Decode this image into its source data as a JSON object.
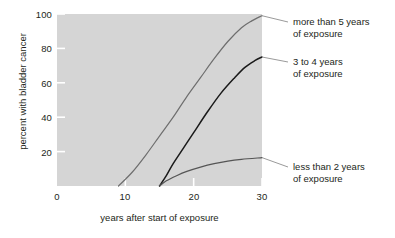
{
  "chart_data": {
    "type": "line",
    "title": "",
    "xlabel": "years after start of exposure",
    "ylabel": "percent with bladder cancer",
    "xlim": [
      0,
      30
    ],
    "ylim": [
      0,
      100
    ],
    "xticks": [
      0,
      10,
      20,
      30
    ],
    "yticks": [
      20,
      40,
      60,
      80,
      100
    ],
    "grid": false,
    "legend_position": "right-inline-annotations",
    "series": [
      {
        "name": "more than 5 years of exposure",
        "color": "#6e6e6e",
        "points": [
          {
            "x": 9,
            "y": 0
          },
          {
            "x": 11,
            "y": 8
          },
          {
            "x": 13,
            "y": 18
          },
          {
            "x": 15,
            "y": 29
          },
          {
            "x": 17,
            "y": 40
          },
          {
            "x": 19,
            "y": 52
          },
          {
            "x": 21,
            "y": 63
          },
          {
            "x": 23,
            "y": 74
          },
          {
            "x": 25,
            "y": 84
          },
          {
            "x": 27,
            "y": 92
          },
          {
            "x": 28.5,
            "y": 96
          },
          {
            "x": 30,
            "y": 99
          }
        ]
      },
      {
        "name": "3 to 4 years of exposure",
        "color": "#1a1a1a",
        "points": [
          {
            "x": 15,
            "y": 0
          },
          {
            "x": 16,
            "y": 6
          },
          {
            "x": 17,
            "y": 13
          },
          {
            "x": 18.5,
            "y": 22
          },
          {
            "x": 20,
            "y": 31
          },
          {
            "x": 22,
            "y": 43
          },
          {
            "x": 24,
            "y": 54
          },
          {
            "x": 26,
            "y": 63
          },
          {
            "x": 27.5,
            "y": 69
          },
          {
            "x": 29,
            "y": 73
          },
          {
            "x": 30,
            "y": 75
          }
        ]
      },
      {
        "name": "less than 2 years of exposure",
        "color": "#555555",
        "points": [
          {
            "x": 15,
            "y": 0
          },
          {
            "x": 16,
            "y": 3
          },
          {
            "x": 17.5,
            "y": 6
          },
          {
            "x": 19,
            "y": 8.5
          },
          {
            "x": 21,
            "y": 11
          },
          {
            "x": 23,
            "y": 13
          },
          {
            "x": 25,
            "y": 14.5
          },
          {
            "x": 27,
            "y": 15.5
          },
          {
            "x": 30,
            "y": 16.5
          }
        ]
      }
    ]
  },
  "axes": {
    "ylabel": "percent with bladder cancer",
    "xlabel": "years after start of exposure",
    "ytick_labels": [
      "100",
      "80",
      "60",
      "40",
      "20"
    ],
    "xtick_labels": [
      "0",
      "10",
      "20",
      "30"
    ]
  },
  "annotations": [
    {
      "line1": "more than 5 years",
      "line2": "of exposure"
    },
    {
      "line1": "3 to 4 years",
      "line2": "of exposure"
    },
    {
      "line1": "less than 2 years",
      "line2": "of exposure"
    }
  ],
  "colors": {
    "plot_background": "#d5d5d5",
    "page_background": "#ffffff",
    "text": "#231f20",
    "tick_mark": "#ffffff",
    "leader_line": "#9a9a9a"
  }
}
